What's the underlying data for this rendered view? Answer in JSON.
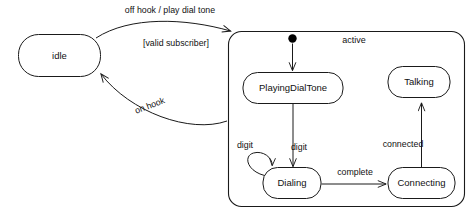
{
  "diagram": {
    "type": "uml-state-machine",
    "background_color": "#ffffff",
    "line_color": "#1a1a1a",
    "text_color": "#111111"
  },
  "states": {
    "idle": {
      "label": "idle",
      "kind": "simple"
    },
    "active": {
      "label": "active",
      "kind": "composite"
    },
    "playing_dial_tone": {
      "label": "PlayingDialTone",
      "kind": "simple"
    },
    "dialing": {
      "label": "Dialing",
      "kind": "simple"
    },
    "connecting": {
      "label": "Connecting",
      "kind": "simple"
    },
    "talking": {
      "label": "Talking",
      "kind": "simple"
    }
  },
  "pseudostates": {
    "initial": {
      "label": "initial-pseudostate",
      "kind": "initial"
    }
  },
  "transitions": {
    "off_hook": {
      "label": "off hook / play dial tone",
      "from": "idle",
      "to": "active"
    },
    "valid_subscriber": {
      "label": "[valid subscriber]",
      "from": "idle",
      "to": "active"
    },
    "on_hook": {
      "label": "on hook",
      "from": "active",
      "to": "idle"
    },
    "initial_to_playing": {
      "label": "",
      "from": "initial",
      "to": "playing_dial_tone"
    },
    "playing_to_dialing": {
      "label": "digit",
      "from": "playing_dial_tone",
      "to": "dialing"
    },
    "dialing_self": {
      "label": "digit",
      "from": "dialing",
      "to": "dialing"
    },
    "dialing_to_connecting": {
      "label": "complete",
      "from": "dialing",
      "to": "connecting"
    },
    "connecting_to_talking": {
      "label": "connected",
      "from": "connecting",
      "to": "talking"
    }
  },
  "footer": {
    "ghost_text": ""
  }
}
